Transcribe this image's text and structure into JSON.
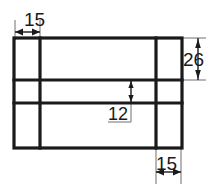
{
  "drawing": {
    "title": "Rectangular plate dimensioned orthographic view",
    "units_implied": "mm",
    "background_color": "#ffffff",
    "object_line_color": "#1a1a1a",
    "extension_line_color": "#6e6e6e",
    "dimension_line_color": "#1a1a1a",
    "outline": {
      "name": "outer-rectangle",
      "x": 14,
      "y": 38,
      "width": 168,
      "height": 110
    },
    "internal_lines": [
      {
        "name": "vertical-line-left",
        "orientation": "vertical",
        "x": 40,
        "y1": 38,
        "y2": 148
      },
      {
        "name": "vertical-line-right",
        "orientation": "vertical",
        "x": 156,
        "y1": 38,
        "y2": 148
      },
      {
        "name": "horizontal-line-upper",
        "orientation": "horizontal",
        "y": 80,
        "x1": 14,
        "x2": 182
      },
      {
        "name": "horizontal-line-lower",
        "orientation": "horizontal",
        "y": 103,
        "x1": 14,
        "x2": 182
      }
    ],
    "dimensions": [
      {
        "id": "dim-15-top-left",
        "value": "15",
        "orientation": "horizontal",
        "placement": "top-left",
        "measures": "distance from left outer edge to left internal vertical line",
        "label_x": 28,
        "label_y": 23,
        "line_y": 32,
        "from_x": 15,
        "to_x": 40
      },
      {
        "id": "dim-26-right",
        "value": "26",
        "orientation": "vertical",
        "placement": "right-outside",
        "measures": "distance from top outer edge to upper internal horizontal line",
        "label_x": 200,
        "label_y": 66,
        "line_x": 198,
        "from_y": 39,
        "to_y": 79
      },
      {
        "id": "dim-12-center",
        "value": "12",
        "orientation": "vertical",
        "placement": "center-inside",
        "measures": "distance between upper and lower internal horizontal lines",
        "label_x": 112,
        "label_y": 116,
        "line_x": 131,
        "from_y": 81,
        "to_y": 102
      },
      {
        "id": "dim-15-bottom-right",
        "value": "15",
        "orientation": "horizontal",
        "placement": "bottom-right",
        "measures": "distance from right internal vertical line to right outer edge",
        "label_x": 158,
        "label_y": 178,
        "line_y": 172,
        "from_x": 156,
        "to_x": 181
      }
    ]
  }
}
